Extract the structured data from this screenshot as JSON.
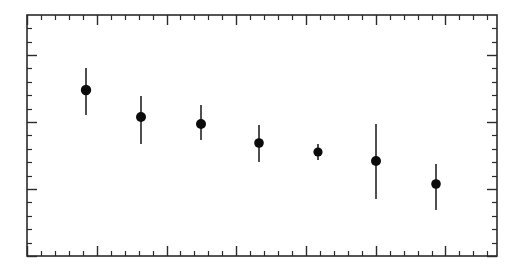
{
  "figure": {
    "title": "",
    "background_color": "#ffffff",
    "ink_color": "#2b2b2b",
    "marker_color": "#0b0b0b",
    "width_px": 521,
    "height_px": 276
  },
  "chart_data": {
    "type": "scatter",
    "title": "",
    "xlabel": "",
    "ylabel": "",
    "grid": false,
    "legend": null,
    "xlim": [
      0,
      8
    ],
    "ylim": [
      0,
      5
    ],
    "x": [
      1.0,
      1.7,
      2.5,
      3.3,
      4.0,
      4.8,
      5.6
    ],
    "values": [
      3.44,
      3.03,
      2.92,
      2.64,
      2.5,
      2.36,
      2.01
    ],
    "yerr_lower": [
      0.33,
      0.32,
      0.25,
      0.27,
      0.1,
      0.55,
      0.36
    ],
    "yerr_upper": [
      0.34,
      0.33,
      0.28,
      0.27,
      0.1,
      0.57,
      0.3
    ],
    "series": [
      {
        "name": "data",
        "marker": "filled-circle",
        "points": [
          {
            "x": 1.0,
            "y": 3.44,
            "err_low": 0.33,
            "err_high": 0.34
          },
          {
            "x": 1.7,
            "y": 3.03,
            "err_low": 0.32,
            "err_high": 0.33
          },
          {
            "x": 2.5,
            "y": 2.92,
            "err_low": 0.25,
            "err_high": 0.28
          },
          {
            "x": 3.3,
            "y": 2.64,
            "err_low": 0.27,
            "err_high": 0.27
          },
          {
            "x": 4.0,
            "y": 2.5,
            "err_low": 0.1,
            "err_high": 0.1
          },
          {
            "x": 4.8,
            "y": 2.36,
            "err_low": 0.55,
            "err_high": 0.57
          },
          {
            "x": 5.6,
            "y": 2.01,
            "err_low": 0.36,
            "err_high": 0.3
          }
        ]
      }
    ],
    "xticks_major": [
      0,
      1,
      2,
      3,
      4,
      5,
      6,
      7,
      8
    ],
    "xticks_minor_per_major": 5,
    "yticks_major": [
      0,
      1,
      2,
      3,
      4,
      5
    ],
    "yticks_minor_per_major": 5,
    "xticklabels": [],
    "yticklabels": [],
    "axis_ticks_direction": "inward",
    "frame": "box-all-sides"
  },
  "axes_pixels": {
    "left": 27,
    "right": 497,
    "top": 15,
    "bottom": 256,
    "x_minor_step": 13.95,
    "y_minor_step": 13.4,
    "major_every": 5,
    "minor_tick_len": 5,
    "major_tick_len": 10
  },
  "points_pixels": [
    {
      "cx": 86,
      "cy": 90,
      "y_top": 68,
      "y_bottom": 115,
      "r": 5.2
    },
    {
      "cx": 141,
      "cy": 117,
      "y_top": 96,
      "y_bottom": 144,
      "r": 5.0
    },
    {
      "cx": 201,
      "cy": 124,
      "y_top": 105,
      "y_bottom": 140,
      "r": 5.0
    },
    {
      "cx": 259,
      "cy": 143,
      "y_top": 125,
      "y_bottom": 162,
      "r": 4.8
    },
    {
      "cx": 318,
      "cy": 152,
      "y_top": 144,
      "y_bottom": 160,
      "r": 4.6
    },
    {
      "cx": 376,
      "cy": 161,
      "y_top": 124,
      "y_bottom": 199,
      "r": 5.0
    },
    {
      "cx": 436,
      "cy": 184,
      "y_top": 164,
      "y_bottom": 210,
      "r": 4.8
    }
  ]
}
